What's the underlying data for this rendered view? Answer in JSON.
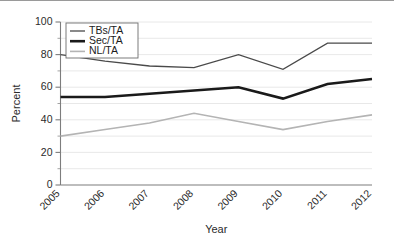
{
  "chart_data": {
    "type": "line",
    "title": "",
    "xlabel": "Year",
    "ylabel": "Percent",
    "x": [
      2005,
      2006,
      2007,
      2008,
      2009,
      2010,
      2011,
      2012
    ],
    "categories": [
      "2005",
      "2006",
      "2007",
      "2008",
      "2009",
      "2010",
      "2011",
      "2012"
    ],
    "series": [
      {
        "name": "TBs/TA",
        "values": [
          80,
          76,
          73,
          72,
          80,
          71,
          87,
          87
        ],
        "color": "#4a4a4a",
        "width": 1.3
      },
      {
        "name": "Sec/TA",
        "values": [
          54,
          54,
          56,
          58,
          60,
          53,
          62,
          65
        ],
        "color": "#1a1a1a",
        "width": 2.6
      },
      {
        "name": "NL/TA",
        "values": [
          30,
          34,
          38,
          44,
          39,
          34,
          39,
          43
        ],
        "color": "#b4b4b4",
        "width": 1.6
      }
    ],
    "ylim": [
      0,
      100
    ],
    "yticks": [
      0,
      20,
      40,
      60,
      80,
      100
    ],
    "ytick_labels": [
      "0",
      "20",
      "40",
      "60",
      "80",
      "100"
    ],
    "yminor_ticks": [
      10,
      30,
      50,
      70,
      90
    ],
    "grid": true,
    "grid_axis": "y",
    "grid_interval": 10,
    "legend_position": "upper-left",
    "xtick_rotation": 45
  },
  "legend": {
    "entries": [
      {
        "label": "TBs/TA"
      },
      {
        "label": "Sec/TA"
      },
      {
        "label": "NL/TA"
      }
    ]
  },
  "axes": {
    "y_title": "Percent",
    "x_title": "Year"
  }
}
